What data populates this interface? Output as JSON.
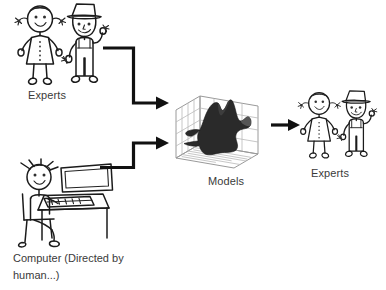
{
  "diagram": {
    "background_color": "#ffffff",
    "ink_color": "#1b1b1b",
    "text_color": "#3a3a3a"
  },
  "nodes": {
    "experts_left": {
      "label": "Experts",
      "figures": [
        "woman-stick-figure",
        "farmer-stick-figure"
      ]
    },
    "computer_operator": {
      "label": "Computer (Directed by\nhuman...)",
      "label_line_1": "Computer (Directed by",
      "label_line_2": "human...)",
      "figures": [
        "person-at-computer-stick-figure"
      ]
    },
    "models": {
      "label": "Models",
      "figures": [
        "3d-surface-plot"
      ]
    },
    "experts_right": {
      "label": "Experts",
      "figures": [
        "woman-stick-figure",
        "farmer-stick-figure"
      ]
    }
  },
  "arrows": [
    {
      "name": "experts-to-models",
      "from": "experts_left",
      "to": "models"
    },
    {
      "name": "computer-to-models",
      "from": "computer_operator",
      "to": "models"
    },
    {
      "name": "models-to-experts",
      "from": "models",
      "to": "experts_right"
    }
  ]
}
